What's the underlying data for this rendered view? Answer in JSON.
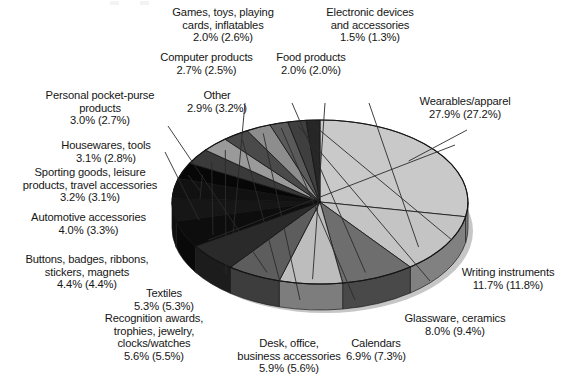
{
  "chart_data": {
    "type": "pie",
    "title": "",
    "subtitle": "",
    "xlabel": "",
    "ylabel": "",
    "legend_position": "none",
    "grid": false,
    "three_d": true,
    "note": "Each label shows current-year share followed by prior-year share in parentheses.",
    "value_suffix": "%",
    "categories": [
      "Wearables/apparel",
      "Writing instruments",
      "Glassware, ceramics",
      "Calendars",
      "Desk, office, business accessories",
      "Recognition awards, trophies, jewelry, clocks/watches",
      "Textiles",
      "Buttons, badges, ribbons, stickers, magnets",
      "Automotive accessories",
      "Sporting goods, leisure products, travel accessories",
      "Housewares, tools",
      "Personal pocket-purse products",
      "Other",
      "Computer products",
      "Games, toys, playing cards, inflatables",
      "Food products",
      "Electronic devices and accessories"
    ],
    "values": [
      27.9,
      11.7,
      8.0,
      6.9,
      5.9,
      5.6,
      5.3,
      4.4,
      4.0,
      3.2,
      3.1,
      3.0,
      2.9,
      2.7,
      2.0,
      2.0,
      1.5
    ],
    "prior_values": [
      27.2,
      11.8,
      9.4,
      7.3,
      5.6,
      5.5,
      5.3,
      4.4,
      3.3,
      3.1,
      2.8,
      2.7,
      3.2,
      2.5,
      2.6,
      2.0,
      1.3
    ],
    "slice_colors": [
      "#c9c9c9",
      "#c4c4c4",
      "#6e6e6e",
      "#bdbdbd",
      "#5d5d5d",
      "#2a2a2a",
      "#0d0d0d",
      "#161616",
      "#111111",
      "#070707",
      "#3a3a3a",
      "#9a9a9a",
      "#4a4a4a",
      "#8d8d8d",
      "#5a5a5a",
      "#3f3f3f",
      "#262626"
    ]
  },
  "labels": [
    {
      "name": "games-toys",
      "text": "Games, toys, playing\ncards, inflatables\n2.0% (2.6%)"
    },
    {
      "name": "electronic-devices",
      "text": "Electronic devices\nand accessories\n1.5% (1.3%)"
    },
    {
      "name": "computer-products",
      "text": "Computer products\n2.7% (2.5%)"
    },
    {
      "name": "food-products",
      "text": "Food products\n2.0% (2.0%)"
    },
    {
      "name": "personal-pocket-purse",
      "text": "Personal pocket-purse\nproducts\n3.0% (2.7%)"
    },
    {
      "name": "other",
      "text": "Other\n2.9% (3.2%)"
    },
    {
      "name": "wearables-apparel",
      "text": "Wearables/apparel\n27.9% (27.2%)"
    },
    {
      "name": "housewares-tools",
      "text": "Housewares, tools\n3.1% (2.8%)"
    },
    {
      "name": "sporting-goods",
      "text": "Sporting goods, leisure\nproducts, travel accessories\n3.2% (3.1%)"
    },
    {
      "name": "automotive-accessories",
      "text": "Automotive accessories\n4.0% (3.3%)"
    },
    {
      "name": "buttons-badges",
      "text": "Buttons, badges, ribbons,\nstickers, magnets\n4.4% (4.4%)"
    },
    {
      "name": "textiles",
      "text": "Textiles\n5.3% (5.3%)"
    },
    {
      "name": "recognition-awards",
      "text": "Recognition awards,\ntrophies, jewelry,\nclocks/watches\n5.6% (5.5%)"
    },
    {
      "name": "desk-office",
      "text": "Desk, office,\nbusiness accessories\n5.9% (5.6%)"
    },
    {
      "name": "calendars",
      "text": "Calendars\n6.9% (7.3%)"
    },
    {
      "name": "glassware-ceramics",
      "text": "Glassware, ceramics\n8.0% (9.4%)"
    },
    {
      "name": "writing-instruments",
      "text": "Writing instruments\n11.7% (11.8%)"
    }
  ]
}
